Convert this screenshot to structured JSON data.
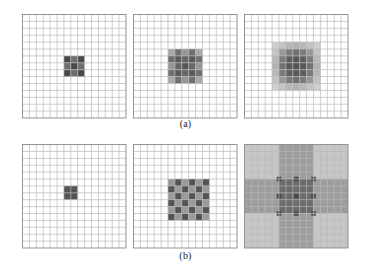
{
  "figure": {
    "background": "#ffffff",
    "grid_line_color": "#b9b9b9",
    "grid_border_color": "#8a8a8a",
    "captions": {
      "row_a": "(a)",
      "row_b": "(b)"
    }
  },
  "chart_data": {
    "type": "heatmap",
    "title": "",
    "subtitle": "",
    "xlabel": "",
    "ylabel": "",
    "grid": true,
    "legend": null,
    "panels": [
      {
        "id": "a1",
        "row": "a",
        "index": 1,
        "grid_cols": 15,
        "grid_rows": 15,
        "pattern": "checkerboard",
        "pattern_size": 3,
        "block_cells": 1,
        "origin_col": 6,
        "origin_row": 6,
        "values": [
          [
            1.0,
            0.72,
            1.0
          ],
          [
            0.72,
            1.0,
            0.72
          ],
          [
            1.0,
            0.72,
            1.0
          ]
        ],
        "colors": [
          [
            "#4a4a4a",
            "#6e6e6e",
            "#4a4a4a"
          ],
          [
            "#6e6e6e",
            "#4a4a4a",
            "#6e6e6e"
          ],
          [
            "#4a4a4a",
            "#6e6e6e",
            "#4a4a4a"
          ]
        ]
      },
      {
        "id": "a2",
        "row": "a",
        "index": 2,
        "grid_cols": 15,
        "grid_rows": 15,
        "pattern": "checkerboard",
        "pattern_size": 5,
        "block_cells": 1,
        "origin_col": 5,
        "origin_row": 5,
        "values": [
          [
            0.45,
            0.8,
            0.55,
            0.8,
            0.45
          ],
          [
            0.8,
            0.95,
            0.85,
            0.95,
            0.8
          ],
          [
            0.55,
            0.85,
            1.0,
            0.85,
            0.55
          ],
          [
            0.8,
            0.95,
            0.85,
            0.95,
            0.8
          ],
          [
            0.45,
            0.8,
            0.55,
            0.8,
            0.45
          ]
        ],
        "colors": [
          [
            "#a8a8a8",
            "#6f6f6f",
            "#969696",
            "#6f6f6f",
            "#a8a8a8"
          ],
          [
            "#6f6f6f",
            "#5a5a5a",
            "#656565",
            "#5a5a5a",
            "#6f6f6f"
          ],
          [
            "#969696",
            "#656565",
            "#555555",
            "#656565",
            "#969696"
          ],
          [
            "#6f6f6f",
            "#5a5a5a",
            "#656565",
            "#5a5a5a",
            "#6f6f6f"
          ],
          [
            "#a8a8a8",
            "#6f6f6f",
            "#969696",
            "#6f6f6f",
            "#a8a8a8"
          ]
        ]
      },
      {
        "id": "a3",
        "row": "a",
        "index": 3,
        "grid_cols": 15,
        "grid_rows": 15,
        "pattern": "checkerboard",
        "pattern_size": 7,
        "block_cells": 1,
        "origin_col": 4,
        "origin_row": 4,
        "values": [
          [
            0.22,
            0.3,
            0.38,
            0.42,
            0.38,
            0.3,
            0.22
          ],
          [
            0.3,
            0.55,
            0.72,
            0.8,
            0.72,
            0.55,
            0.3
          ],
          [
            0.38,
            0.72,
            0.92,
            0.96,
            0.92,
            0.72,
            0.38
          ],
          [
            0.42,
            0.8,
            0.96,
            1.0,
            0.96,
            0.8,
            0.42
          ],
          [
            0.38,
            0.72,
            0.92,
            0.96,
            0.92,
            0.72,
            0.38
          ],
          [
            0.3,
            0.55,
            0.72,
            0.8,
            0.72,
            0.55,
            0.3
          ],
          [
            0.22,
            0.3,
            0.38,
            0.42,
            0.38,
            0.3,
            0.22
          ]
        ],
        "colors": [
          [
            "#cfcfcf",
            "#c4c4c4",
            "#b8b8b8",
            "#b2b2b2",
            "#b8b8b8",
            "#c4c4c4",
            "#cfcfcf"
          ],
          [
            "#c4c4c4",
            "#989898",
            "#7b7b7b",
            "#707070",
            "#7b7b7b",
            "#989898",
            "#c4c4c4"
          ],
          [
            "#b8b8b8",
            "#7b7b7b",
            "#5e5e5e",
            "#585858",
            "#5e5e5e",
            "#7b7b7b",
            "#b8b8b8"
          ],
          [
            "#b2b2b2",
            "#707070",
            "#585858",
            "#525252",
            "#585858",
            "#707070",
            "#b2b2b2"
          ],
          [
            "#b8b8b8",
            "#7b7b7b",
            "#5e5e5e",
            "#585858",
            "#5e5e5e",
            "#7b7b7b",
            "#b8b8b8"
          ],
          [
            "#c4c4c4",
            "#989898",
            "#7b7b7b",
            "#707070",
            "#7b7b7b",
            "#989898",
            "#c4c4c4"
          ],
          [
            "#cfcfcf",
            "#c4c4c4",
            "#b8b8b8",
            "#b2b2b2",
            "#b8b8b8",
            "#c4c4c4",
            "#cfcfcf"
          ]
        ]
      },
      {
        "id": "b1",
        "row": "b",
        "index": 1,
        "grid_cols": 15,
        "grid_rows": 15,
        "pattern": "single-block",
        "pattern_size": 1,
        "block_cells": 2,
        "origin_col": 6,
        "origin_row": 6,
        "values": [
          [
            1.0
          ]
        ],
        "colors": [
          [
            "#555555"
          ]
        ]
      },
      {
        "id": "b2",
        "row": "b",
        "index": 2,
        "grid_cols": 15,
        "grid_rows": 15,
        "pattern": "fine-checkerboard",
        "pattern_size": 6,
        "block_cells": 1,
        "origin_col": 5,
        "origin_row": 5,
        "values": [
          [
            0.62,
            0.95,
            0.62,
            0.95,
            0.62,
            0.95
          ],
          [
            0.95,
            0.62,
            0.95,
            0.62,
            0.95,
            0.62
          ],
          [
            0.62,
            0.95,
            0.62,
            0.95,
            0.62,
            0.95
          ],
          [
            0.95,
            0.62,
            0.95,
            0.62,
            0.95,
            0.62
          ],
          [
            0.62,
            0.95,
            0.62,
            0.95,
            0.62,
            0.95
          ],
          [
            0.95,
            0.62,
            0.95,
            0.62,
            0.95,
            0.62
          ]
        ],
        "colors": [
          [
            "#9a9a9a",
            "#545454",
            "#9a9a9a",
            "#545454",
            "#9a9a9a",
            "#545454"
          ],
          [
            "#545454",
            "#9a9a9a",
            "#545454",
            "#9a9a9a",
            "#545454",
            "#9a9a9a"
          ],
          [
            "#9a9a9a",
            "#545454",
            "#9a9a9a",
            "#545454",
            "#9a9a9a",
            "#545454"
          ],
          [
            "#545454",
            "#9a9a9a",
            "#545454",
            "#9a9a9a",
            "#545454",
            "#9a9a9a"
          ],
          [
            "#9a9a9a",
            "#545454",
            "#9a9a9a",
            "#545454",
            "#9a9a9a",
            "#545454"
          ],
          [
            "#545454",
            "#9a9a9a",
            "#545454",
            "#9a9a9a",
            "#545454",
            "#9a9a9a"
          ]
        ]
      },
      {
        "id": "b3",
        "row": "b",
        "index": 3,
        "grid_cols": 15,
        "grid_rows": 15,
        "pattern": "coarse-blocks",
        "pattern_size": 3,
        "block_cells": 5,
        "origin_col": 0,
        "origin_row": 0,
        "values": [
          [
            0.3,
            0.62,
            0.3
          ],
          [
            0.62,
            1.0,
            0.62
          ],
          [
            0.3,
            0.62,
            0.3
          ]
        ],
        "colors": [
          [
            "#c6c6c6",
            "#9d9d9d",
            "#c6c6c6"
          ],
          [
            "#9d9d9d",
            "#6b6b6b",
            "#9d9d9d"
          ],
          [
            "#c6c6c6",
            "#9d9d9d",
            "#c6c6c6"
          ]
        ],
        "corner_marks": {
          "color": "#4a4a4a",
          "count": 9
        }
      }
    ]
  }
}
